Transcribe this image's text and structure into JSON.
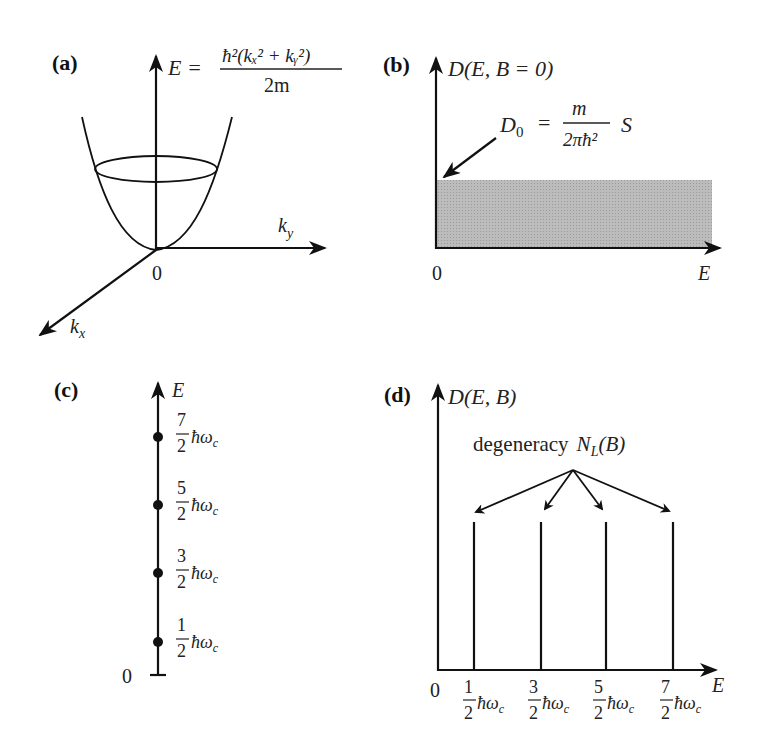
{
  "figure": {
    "panels": {
      "a": {
        "label": "(a)",
        "energy_axis": "E",
        "formula_lhs": "E =",
        "formula_numerator": "ħ²(kₓ² + kᵧ²)",
        "formula_denominator": "2m",
        "ky_axis": "k",
        "ky_sub": "y",
        "kx_axis": "k",
        "kx_sub": "x",
        "origin": "0"
      },
      "b": {
        "label": "(b)",
        "y_axis": "D(E, B = 0)",
        "x_axis": "E",
        "origin": "0",
        "annotation_lhs": "D",
        "annotation_sub": "0",
        "annotation_eq": "=",
        "annotation_numerator": "m",
        "annotation_denominator": "2πħ²",
        "annotation_suffix": "S",
        "fill_color": "#b4b4b4"
      },
      "c": {
        "label": "(c)",
        "axis": "E",
        "origin": "0",
        "levels": [
          {
            "num": "7",
            "den": "2",
            "unit": "ħω",
            "sub": "c"
          },
          {
            "num": "5",
            "den": "2",
            "unit": "ħω",
            "sub": "c"
          },
          {
            "num": "3",
            "den": "2",
            "unit": "ħω",
            "sub": "c"
          },
          {
            "num": "1",
            "den": "2",
            "unit": "ħω",
            "sub": "c"
          }
        ]
      },
      "d": {
        "label": "(d)",
        "y_axis": "D(E, B)",
        "x_axis": "E",
        "origin": "0",
        "annotation_text": "degeneracy",
        "annotation_math": "N",
        "annotation_sub": "L",
        "annotation_arg": "(B)",
        "ticks": [
          {
            "num": "1",
            "den": "2",
            "unit": "ħω",
            "sub": "c"
          },
          {
            "num": "3",
            "den": "2",
            "unit": "ħω",
            "sub": "c"
          },
          {
            "num": "5",
            "den": "2",
            "unit": "ħω",
            "sub": "c"
          },
          {
            "num": "7",
            "den": "2",
            "unit": "ħω",
            "sub": "c"
          }
        ]
      }
    }
  }
}
